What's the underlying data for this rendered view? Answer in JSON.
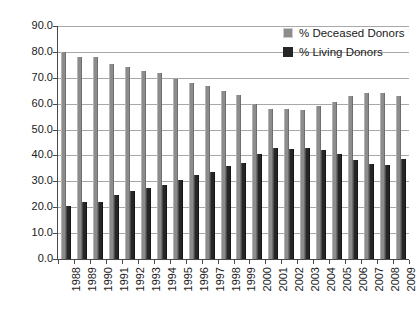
{
  "chart_data": {
    "type": "bar",
    "title": "",
    "subtitle": "",
    "xlabel": "",
    "ylabel": "",
    "ylim": [
      0.0,
      90.0
    ],
    "ytick_step": 10.0,
    "ytick_labels": [
      "90.0",
      "80.0",
      "70.0",
      "60.0",
      "50.0",
      "40.0",
      "30.0",
      "20.0",
      "10.0",
      "0.0"
    ],
    "ytick_values": [
      90.0,
      80.0,
      70.0,
      60.0,
      50.0,
      40.0,
      30.0,
      20.0,
      10.0,
      0.0
    ],
    "grid": true,
    "grid_axis": "y",
    "legend_position": "top-right-inside",
    "categories": [
      "1988",
      "1989",
      "1990",
      "1991",
      "1992",
      "1993",
      "1994",
      "1995",
      "1996",
      "1997",
      "1998",
      "1999",
      "2000",
      "2001",
      "2002",
      "2003",
      "2004",
      "2005",
      "2006",
      "2007",
      "2008",
      "2009"
    ],
    "series": [
      {
        "name": "% Deceased Donors",
        "color": "#8c8c8c",
        "values": [
          79.8,
          78.0,
          78.0,
          75.4,
          74.2,
          72.7,
          72.0,
          69.6,
          68.0,
          66.7,
          64.9,
          63.3,
          59.7,
          58.0,
          58.1,
          57.5,
          59.0,
          60.6,
          62.9,
          64.2,
          64.2,
          62.8
        ]
      },
      {
        "name": "% Living Donors",
        "color": "#262626",
        "values": [
          20.4,
          21.9,
          22.1,
          24.8,
          26.2,
          27.5,
          28.4,
          30.6,
          32.4,
          33.8,
          35.8,
          37.2,
          40.4,
          42.7,
          42.5,
          43.0,
          42.0,
          40.6,
          38.3,
          36.8,
          36.5,
          38.7
        ]
      }
    ]
  },
  "legend": {
    "items": [
      {
        "label": "% Deceased Donors",
        "swatch": "deceased"
      },
      {
        "label": "% Living Donors",
        "swatch": "living"
      }
    ]
  }
}
